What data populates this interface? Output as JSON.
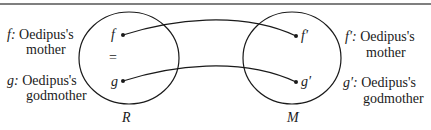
{
  "left_labels": [
    {
      "symbol": "f:",
      "line1": "Oedipus's",
      "line2": "mother"
    },
    {
      "symbol": "g:",
      "line1": "Oedipus's",
      "line2": "godmother"
    }
  ],
  "right_labels": [
    {
      "symbol": "f′:",
      "line1": "Oedipus's",
      "line2": "mother"
    },
    {
      "symbol": "g′:",
      "line1": "Oedipus's",
      "line2": "godmother"
    }
  ],
  "circle_R": {
    "label": "R",
    "points": [
      "f",
      "g"
    ],
    "relation": "="
  },
  "circle_M": {
    "label": "M",
    "points": [
      "f′",
      "g′"
    ]
  },
  "colors": {
    "ink": "#1a1a1a",
    "rule": "#555555"
  }
}
